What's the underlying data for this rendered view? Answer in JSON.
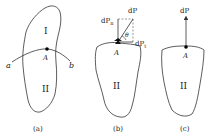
{
  "figure": {
    "panel_a": {
      "caption": "(a)",
      "region_upper": "I",
      "region_lower": "II",
      "point": "A",
      "curve_start": "a",
      "curve_end": "b"
    },
    "panel_b": {
      "caption": "(b)",
      "region": "II",
      "point": "A",
      "force_total": "dP",
      "force_normal": "dP",
      "force_normal_sub": "n",
      "force_tangent": "dP",
      "force_tangent_sub": "t",
      "angle": "θ"
    },
    "panel_c": {
      "caption": "(c)",
      "region": "II",
      "point": "A",
      "force": "dP"
    }
  },
  "colors": {
    "stroke": "#333333",
    "text": "#222222"
  }
}
